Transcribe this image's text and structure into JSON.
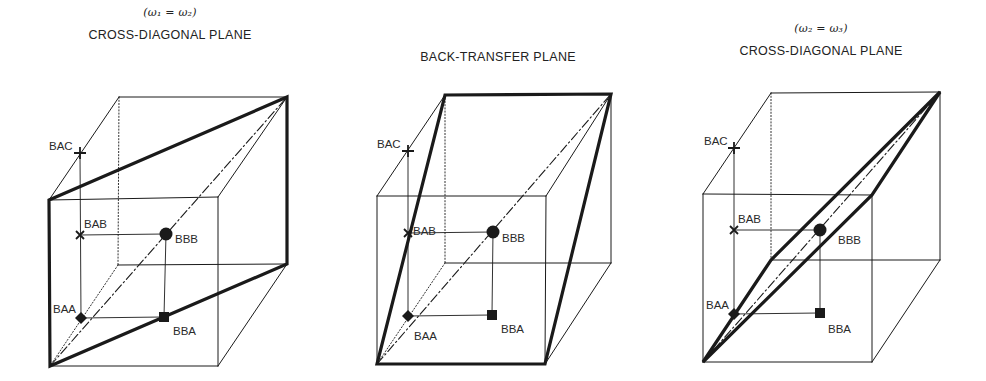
{
  "figure": {
    "width": 986,
    "height": 381,
    "line_color": "#1a1a1a",
    "background": "#ffffff"
  },
  "panels": [
    {
      "id": "panel-1",
      "subtitle": "(ω₁ = ω₂)",
      "title": "CROSS-DIAGONAL PLANE",
      "title_pos": [
        170,
        30
      ],
      "subtitle_pos": [
        170,
        6
      ],
      "cube": {
        "back_top_left": [
          119,
          97
        ],
        "back_top_right": [
          287,
          97
        ],
        "back_bottom_left": [
          118,
          265
        ],
        "back_bottom_right": [
          287,
          264
        ],
        "front_top_left": [
          49,
          200
        ],
        "front_top_right": [
          218,
          197
        ],
        "front_bottom_left": [
          50,
          366
        ],
        "front_bottom_right": [
          218,
          366
        ]
      },
      "plane": [
        [
          49,
          200
        ],
        [
          287,
          97
        ],
        [
          287,
          264
        ],
        [
          50,
          366
        ]
      ],
      "diagonal": [
        [
          50,
          366
        ],
        [
          287,
          97
        ]
      ],
      "points": [
        {
          "label": "BAC",
          "marker": "plus",
          "pos": [
            80,
            153
          ],
          "label_pos": [
            49,
            146
          ]
        },
        {
          "label": "BAB",
          "marker": "cross",
          "pos": [
            80,
            235
          ],
          "label_pos": [
            84,
            224
          ]
        },
        {
          "label": "BBB",
          "marker": "circle",
          "pos": [
            166,
            234
          ],
          "label_pos": [
            175,
            239
          ]
        },
        {
          "label": "BAA",
          "marker": "diamond",
          "pos": [
            81,
            318
          ],
          "label_pos": [
            53,
            309
          ]
        },
        {
          "label": "BBA",
          "marker": "square",
          "pos": [
            164,
            317
          ],
          "label_pos": [
            173,
            331
          ]
        }
      ]
    },
    {
      "id": "panel-2",
      "subtitle": "",
      "title": "BACK-TRANSFER PLANE",
      "title_pos": [
        498,
        52
      ],
      "subtitle_pos": [
        498,
        30
      ],
      "cube": {
        "back_top_left": [
          445,
          95
        ],
        "back_top_right": [
          611,
          94
        ],
        "back_bottom_left": [
          445,
          263
        ],
        "back_bottom_right": [
          611,
          263
        ],
        "front_top_left": [
          377,
          196
        ],
        "front_top_right": [
          546,
          196
        ],
        "front_bottom_left": [
          377,
          364
        ],
        "front_bottom_right": [
          545,
          364
        ]
      },
      "plane": [
        [
          377,
          364
        ],
        [
          445,
          95
        ],
        [
          611,
          94
        ],
        [
          545,
          364
        ]
      ],
      "diagonal": [
        [
          377,
          364
        ],
        [
          611,
          94
        ]
      ],
      "points": [
        {
          "label": "BAC",
          "marker": "plus",
          "pos": [
            408,
            151
          ],
          "label_pos": [
            377,
            144
          ]
        },
        {
          "label": "BAB",
          "marker": "cross",
          "pos": [
            408,
            233
          ],
          "label_pos": [
            413,
            231
          ]
        },
        {
          "label": "BBB",
          "marker": "circle",
          "pos": [
            493,
            232
          ],
          "label_pos": [
            502,
            238
          ]
        },
        {
          "label": "BAA",
          "marker": "diamond",
          "pos": [
            408,
            316
          ],
          "label_pos": [
            414,
            336
          ]
        },
        {
          "label": "BBA",
          "marker": "square",
          "pos": [
            492,
            315
          ],
          "label_pos": [
            501,
            329
          ]
        }
      ]
    },
    {
      "id": "panel-3",
      "subtitle": "(ω₂ = ω₃)",
      "title": "CROSS-DIAGONAL PLANE",
      "title_pos": [
        821,
        45
      ],
      "subtitle_pos": [
        821,
        22
      ],
      "cube": {
        "back_top_left": [
          771,
          93
        ],
        "back_top_right": [
          940,
          92
        ],
        "back_bottom_left": [
          771,
          260
        ],
        "back_bottom_right": [
          940,
          260
        ],
        "front_top_left": [
          703,
          194
        ],
        "front_top_right": [
          872,
          195
        ],
        "front_bottom_left": [
          703,
          362
        ],
        "front_bottom_right": [
          872,
          362
        ]
      },
      "plane": [
        [
          703,
          362
        ],
        [
          771,
          260
        ],
        [
          940,
          92
        ],
        [
          872,
          195
        ]
      ],
      "diagonal": [
        [
          703,
          362
        ],
        [
          940,
          92
        ]
      ],
      "points": [
        {
          "label": "BAC",
          "marker": "plus",
          "pos": [
            734,
            148
          ],
          "label_pos": [
            704,
            141
          ]
        },
        {
          "label": "BAB",
          "marker": "cross",
          "pos": [
            734,
            230
          ],
          "label_pos": [
            738,
            219
          ]
        },
        {
          "label": "BBB",
          "marker": "circle",
          "pos": [
            820,
            230
          ],
          "label_pos": [
            838,
            240
          ]
        },
        {
          "label": "BAA",
          "marker": "diamond",
          "pos": [
            734,
            314
          ],
          "label_pos": [
            706,
            305
          ]
        },
        {
          "label": "BBA",
          "marker": "square",
          "pos": [
            820,
            313
          ],
          "label_pos": [
            828,
            329
          ]
        }
      ]
    }
  ],
  "legend_markers": {
    "BAC": "plus",
    "BAB": "cross",
    "BBB": "filled-circle",
    "BAA": "filled-diamond",
    "BBA": "filled-square"
  }
}
